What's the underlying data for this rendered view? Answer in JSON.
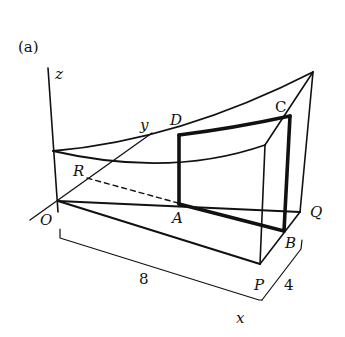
{
  "figure": {
    "panel_label": "(a)",
    "axes": {
      "x": "x",
      "y": "y",
      "z": "z"
    },
    "points": {
      "O": "O",
      "R": "R",
      "A": "A",
      "D": "D",
      "C": "C",
      "B": "B",
      "P": "P",
      "Q": "Q"
    },
    "dimensions": {
      "length": "8",
      "width": "4"
    }
  }
}
